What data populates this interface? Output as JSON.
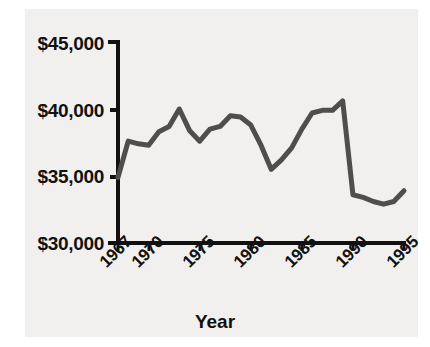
{
  "chart_data": {
    "type": "line",
    "title": "",
    "subtitle": "",
    "xlabel": "Year",
    "ylabel": "",
    "xlim": [
      1967,
      1995
    ],
    "ylim": [
      30000,
      45000
    ],
    "grid": false,
    "legend": "none",
    "series_color": "#4e4e4e",
    "xtick_labels": [
      "1967",
      "1970",
      "1975",
      "1980",
      "1985",
      "1990",
      "1995"
    ],
    "xtick_values": [
      1967,
      1970,
      1975,
      1980,
      1985,
      1990,
      1995
    ],
    "ytick_labels": [
      "$30,000",
      "$35,000",
      "$40,000",
      "$45,000"
    ],
    "ytick_values": [
      30000,
      35000,
      40000,
      45000
    ],
    "x": [
      1967,
      1968,
      1969,
      1970,
      1971,
      1972,
      1973,
      1974,
      1975,
      1976,
      1977,
      1978,
      1979,
      1980,
      1981,
      1982,
      1983,
      1984,
      1985,
      1986,
      1987,
      1988,
      1989,
      1990,
      1991,
      1992,
      1993,
      1994,
      1995
    ],
    "values": [
      34900,
      37600,
      37400,
      37300,
      38300,
      38700,
      40000,
      38400,
      37600,
      38500,
      38700,
      39500,
      39400,
      38800,
      37300,
      35500,
      36200,
      37100,
      38500,
      39700,
      39900,
      39900,
      40600,
      33600,
      33400,
      33100,
      32900,
      33100,
      33900
    ],
    "series": [
      {
        "name": "Median income",
        "values": [
          34900,
          37600,
          37400,
          37300,
          38300,
          38700,
          40000,
          38400,
          37600,
          38500,
          38700,
          39500,
          39400,
          38800,
          37300,
          35500,
          36200,
          37100,
          38500,
          39700,
          39900,
          39900,
          40600,
          33600,
          33400,
          33100,
          32900,
          33100,
          33900
        ]
      }
    ],
    "annotations": []
  },
  "axes": {
    "y_labels": [
      {
        "text": "$45,000",
        "top": 33
      },
      {
        "text": "$40,000",
        "top": 100
      },
      {
        "text": "$35,000",
        "top": 166
      },
      {
        "text": "$30,000",
        "top": 233
      }
    ],
    "x_labels": [
      {
        "text": "1967",
        "left": 96,
        "top": 258
      },
      {
        "text": "1970",
        "left": 128,
        "top": 258
      },
      {
        "text": "1975",
        "left": 179,
        "top": 258
      },
      {
        "text": "1980",
        "left": 230,
        "top": 258
      },
      {
        "text": "1985",
        "left": 281,
        "top": 258
      },
      {
        "text": "1990",
        "left": 332,
        "top": 258
      },
      {
        "text": "1995",
        "left": 383,
        "top": 258
      }
    ],
    "x_title": "Year"
  }
}
